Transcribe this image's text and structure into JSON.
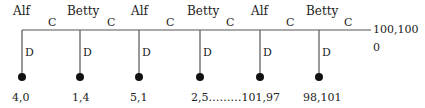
{
  "diagram": {
    "type": "centipede-game-tree",
    "nodes": [
      {
        "player": "Alf",
        "x": 22,
        "continue": "C",
        "defect": "D",
        "payoff": "4,0"
      },
      {
        "player": "Betty",
        "x": 80,
        "continue": "C",
        "defect": "D",
        "payoff": "1,4"
      },
      {
        "player": "Alf",
        "x": 139,
        "continue": "C",
        "defect": "D",
        "payoff": "5,1"
      },
      {
        "player": "Betty",
        "x": 200,
        "continue": "C",
        "defect": "D",
        "payoff": "2,5………101,97"
      },
      {
        "player": "Alf",
        "x": 260,
        "continue": "C",
        "defect": "D",
        "payoff": ""
      },
      {
        "player": "Betty",
        "x": 319,
        "continue": "C",
        "defect": "D",
        "payoff": "98,101"
      }
    ],
    "terminal": {
      "payoff": "100,100",
      "extra": "0"
    },
    "colors": {
      "line": "#555555",
      "dot": "#111111",
      "text": "#222222"
    }
  }
}
